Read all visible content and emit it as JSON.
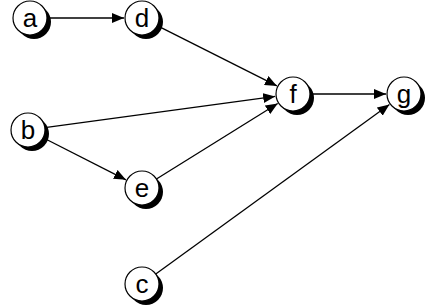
{
  "diagram": {
    "type": "directed-graph",
    "nodes": [
      {
        "id": "a",
        "label": "a",
        "x": 30,
        "y": 18
      },
      {
        "id": "d",
        "label": "d",
        "x": 142,
        "y": 18
      },
      {
        "id": "b",
        "label": "b",
        "x": 28,
        "y": 130
      },
      {
        "id": "e",
        "label": "e",
        "x": 142,
        "y": 188
      },
      {
        "id": "f",
        "label": "f",
        "x": 293,
        "y": 94
      },
      {
        "id": "g",
        "label": "g",
        "x": 404,
        "y": 94
      },
      {
        "id": "c",
        "label": "c",
        "x": 142,
        "y": 284
      }
    ],
    "edges": [
      {
        "from": "a",
        "to": "d"
      },
      {
        "from": "d",
        "to": "f"
      },
      {
        "from": "b",
        "to": "f"
      },
      {
        "from": "b",
        "to": "e"
      },
      {
        "from": "e",
        "to": "f"
      },
      {
        "from": "f",
        "to": "g"
      },
      {
        "from": "c",
        "to": "g"
      }
    ],
    "style": {
      "node_radius": 17,
      "node_fill": "#ffffff",
      "node_stroke": "#000000",
      "shadow_color": "#000000",
      "shadow_offset": 4,
      "edge_color": "#000000"
    }
  }
}
